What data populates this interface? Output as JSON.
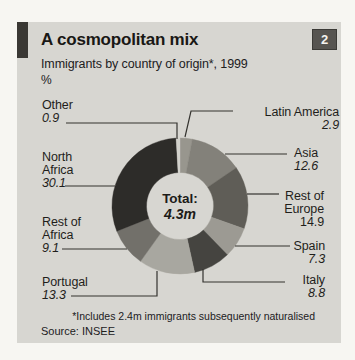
{
  "page_number": "2",
  "header": {
    "title": "A cosmopolitan mix",
    "subtitle": "Immigrants by country of origin*, 1999",
    "unit": "%"
  },
  "footer": {
    "footnote": "*Includes 2.4m immigrants subsequently naturalised",
    "source": "Source: INSEE"
  },
  "colors": {
    "card_background": "#d7d6d1",
    "page_background": "#f7f6f2",
    "corner_tab": "#3a3834",
    "number_box": "#565450",
    "leader_line": "#34332f",
    "text": "#1f1e1b"
  },
  "chart_data": {
    "type": "pie",
    "subtype": "donut",
    "title": "A cosmopolitan mix",
    "subtitle": "Immigrants by country of origin*, 1999",
    "unit": "%",
    "center_label": "Total:",
    "center_value": "4.3m",
    "start_angle_deg": 0,
    "direction": "clockwise",
    "slices": [
      {
        "name": "Latin America",
        "value": 2.9,
        "color": "#98968e"
      },
      {
        "name": "Asia",
        "value": 12.6,
        "color": "#83817a"
      },
      {
        "name": "Rest of Europe",
        "value": 14.9,
        "color": "#5f5d57"
      },
      {
        "name": "Spain",
        "value": 7.3,
        "color": "#9c9a93"
      },
      {
        "name": "Italy",
        "value": 8.8,
        "color": "#454440"
      },
      {
        "name": "Portugal",
        "value": 13.3,
        "color": "#a8a7a0"
      },
      {
        "name": "Rest of Africa",
        "value": 9.1,
        "color": "#72706a"
      },
      {
        "name": "North Africa",
        "value": 30.1,
        "color": "#2d2c29"
      },
      {
        "name": "Other",
        "value": 0.9,
        "color": "#d2d1cb"
      }
    ]
  }
}
